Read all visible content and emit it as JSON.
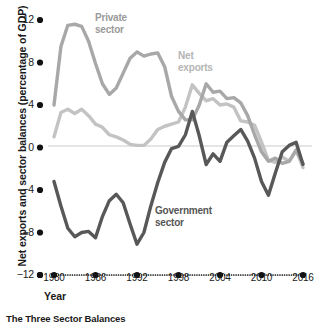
{
  "caption": "The Three Sector Balances",
  "axes": {
    "ylabel": "Net exports and sector balances (percentage of GDP)",
    "xlabel": "Year",
    "yticks": [
      "12",
      "8",
      "4",
      "0",
      "−4",
      "−8",
      "−12"
    ],
    "xticks": [
      "1980",
      "1986",
      "1992",
      "1998",
      "2004",
      "2010",
      "2016"
    ]
  },
  "labels": {
    "private": "Private\nsector",
    "private_line1": "Private",
    "private_line2": "sector",
    "netexports_line1": "Net",
    "netexports_line2": "exports",
    "government_line1": "Government",
    "government_line2": "sector"
  },
  "colors": {
    "private": "#a8a8a8",
    "net_exports": "#c3c3c3",
    "government": "#585858",
    "zero_line": "#cccccc",
    "axis_dots": "#111111",
    "text": "#1a1a1a"
  },
  "chart_data": {
    "type": "line",
    "title": "The Three Sector Balances",
    "xlabel": "Year",
    "ylabel": "Net exports and sector balances (percentage of GDP)",
    "xlim": [
      1980,
      2016
    ],
    "ylim": [
      -12,
      12
    ],
    "grid": false,
    "legend": "inline-annotations",
    "x": [
      1980,
      1981,
      1982,
      1983,
      1984,
      1985,
      1986,
      1987,
      1988,
      1989,
      1990,
      1991,
      1992,
      1993,
      1994,
      1995,
      1996,
      1997,
      1998,
      1999,
      2000,
      2001,
      2002,
      2003,
      2004,
      2005,
      2006,
      2007,
      2008,
      2009,
      2010,
      2011,
      2012,
      2013,
      2014,
      2015,
      2016
    ],
    "series": [
      {
        "name": "Private sector",
        "color": "#a8a8a8",
        "values": [
          4.0,
          9.5,
          11.5,
          11.6,
          11.4,
          10.0,
          7.9,
          6.0,
          5.0,
          5.6,
          7.0,
          8.4,
          9.0,
          8.6,
          8.8,
          8.9,
          7.6,
          4.8,
          3.4,
          2.6,
          2.6,
          4.0,
          6.0,
          5.2,
          5.3,
          4.6,
          4.7,
          4.2,
          3.0,
          1.2,
          -0.4,
          -1.3,
          -1.0,
          -1.5,
          -1.3,
          -0.3,
          -1.5
        ]
      },
      {
        "name": "Net exports",
        "color": "#c3c3c3",
        "values": [
          1.0,
          3.3,
          3.6,
          3.2,
          3.6,
          3.0,
          2.2,
          1.9,
          1.2,
          1.0,
          0.7,
          0.3,
          0.2,
          0.2,
          0.8,
          1.7,
          2.0,
          2.2,
          2.4,
          3.8,
          5.9,
          5.1,
          4.4,
          4.6,
          4.0,
          4.1,
          3.8,
          2.5,
          2.4,
          2.1,
          0.5,
          -1.2,
          -1.4,
          -0.9,
          -1.3,
          -0.2,
          -1.9
        ]
      },
      {
        "name": "Government sector",
        "color": "#585858",
        "values": [
          -3.2,
          -5.5,
          -7.6,
          -8.4,
          -8.0,
          -7.9,
          -8.5,
          -6.5,
          -5.0,
          -4.4,
          -5.2,
          -7.2,
          -9.1,
          -8.0,
          -5.5,
          -3.3,
          -1.4,
          -0.1,
          0.1,
          1.2,
          3.4,
          1.1,
          -1.6,
          -0.6,
          -1.3,
          0.5,
          1.1,
          1.7,
          0.6,
          -1.0,
          -3.2,
          -4.5,
          -2.4,
          -0.4,
          0.2,
          0.5,
          -1.6
        ]
      }
    ]
  }
}
